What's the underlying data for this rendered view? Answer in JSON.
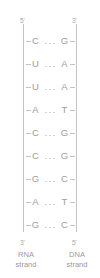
{
  "diagram": {
    "colors": {
      "text": "#9a9a9a",
      "line": "#c4c4c4",
      "background": "#ffffff"
    },
    "ends": {
      "top_left": "5'",
      "top_right": "3'",
      "bottom_left": "3'",
      "bottom_right": "5'"
    },
    "hydrogen_bond_symbol": "...",
    "base_pairs": [
      {
        "left": "C",
        "bond": "...",
        "right": "G"
      },
      {
        "left": "U",
        "bond": "...",
        "right": "A"
      },
      {
        "left": "U",
        "bond": "...",
        "right": "A"
      },
      {
        "left": "A",
        "bond": "...",
        "right": "T"
      },
      {
        "left": "C",
        "bond": "...",
        "right": "G"
      },
      {
        "left": "C",
        "bond": "...",
        "right": "G"
      },
      {
        "left": "G",
        "bond": "...",
        "right": "C"
      },
      {
        "left": "A",
        "bond": "...",
        "right": "T"
      },
      {
        "left": "G",
        "bond": "...",
        "right": "C"
      }
    ],
    "strands": {
      "left": {
        "name": "RNA",
        "kind": "strand"
      },
      "right": {
        "name": "DNA",
        "kind": "strand"
      }
    }
  }
}
